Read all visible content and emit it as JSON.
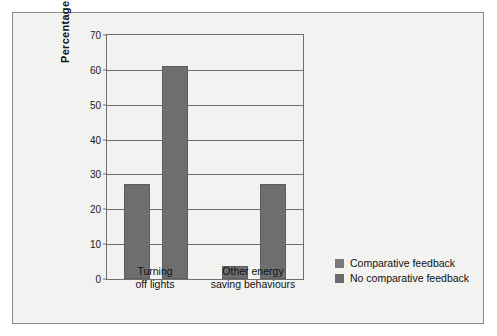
{
  "chart_data": {
    "type": "bar",
    "title": "",
    "xlabel": "",
    "ylabel": "Percentage  improvement",
    "ylim": [
      0,
      70
    ],
    "yticks": [
      0,
      10,
      20,
      30,
      40,
      50,
      60,
      70
    ],
    "ytick_labels": [
      "0",
      "10",
      "20",
      "30",
      "40",
      "50",
      "60",
      "70"
    ],
    "grid": true,
    "legend_position": "right-bottom",
    "categories": [
      "Turning off lights",
      "Other energy saving behaviours"
    ],
    "category_lines": [
      [
        "Turning",
        "off lights"
      ],
      [
        "Other energy",
        "saving behaviours"
      ]
    ],
    "series": [
      {
        "name": "Comparative feedback",
        "color": "#6e6e6e",
        "values": [
          27.2,
          3.7
        ]
      },
      {
        "name": "No comparative feedback",
        "color": "#6e6e6e",
        "values": [
          61.0,
          27.4
        ]
      }
    ]
  },
  "legend": {
    "items": [
      {
        "label": "Comparative feedback",
        "color": "#7a7a7a"
      },
      {
        "label": "No comparative feedback",
        "color": "#6b6b6b"
      }
    ]
  },
  "colors": {
    "bar": "#6e6e6e",
    "bar_border": "#5d5d5d",
    "grid": "#6f6f6f",
    "frame": "#8a8a8a",
    "panel_background": "#f2f2f0",
    "text": "#111111"
  }
}
